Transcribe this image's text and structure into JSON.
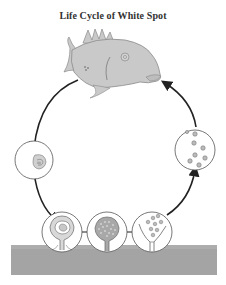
{
  "title": "Life Cycle of White Spot",
  "stages": [
    {
      "id": "fish",
      "label": "Infected fish host",
      "icon": "fish-icon"
    },
    {
      "id": "trophont",
      "label": "Detached parasite (trophont)",
      "icon": "trophont-icon"
    },
    {
      "id": "cyst-forming",
      "label": "Encysted parasite on substrate",
      "icon": "cyst-icon"
    },
    {
      "id": "cyst-dividing",
      "label": "Dividing cyst (tomont)",
      "icon": "dividing-cyst-icon"
    },
    {
      "id": "cyst-bursting",
      "label": "Bursting cyst releasing tomites",
      "icon": "bursting-cyst-icon"
    },
    {
      "id": "tomites",
      "label": "Free-swimming tomites (theronts)",
      "icon": "tomites-icon"
    }
  ],
  "colors": {
    "fish_fill": "#c9c9c9",
    "fish_stroke": "#8a8a8a",
    "arrow": "#222222",
    "circle_stroke": "#555555",
    "ground": "#a4a4a4",
    "background": "#ffffff"
  }
}
